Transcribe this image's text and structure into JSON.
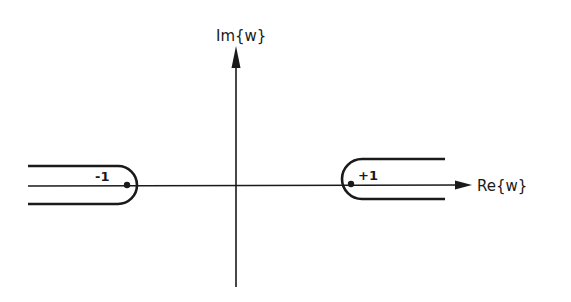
{
  "diagram": {
    "type": "complex-plane-contour",
    "axes": {
      "imag_label": "Im{w}",
      "real_label": "Re{w}"
    },
    "points": [
      {
        "label": "-1",
        "value": -1
      },
      {
        "label": "+1",
        "value": 1
      }
    ],
    "contours": [
      {
        "name": "left-keyhole",
        "around": "-1",
        "direction": "extends to -infinity"
      },
      {
        "name": "right-keyhole",
        "around": "+1",
        "direction": "extends to +infinity"
      }
    ],
    "colors": {
      "line": "#1a1a1a",
      "background": "#ffffff"
    }
  }
}
